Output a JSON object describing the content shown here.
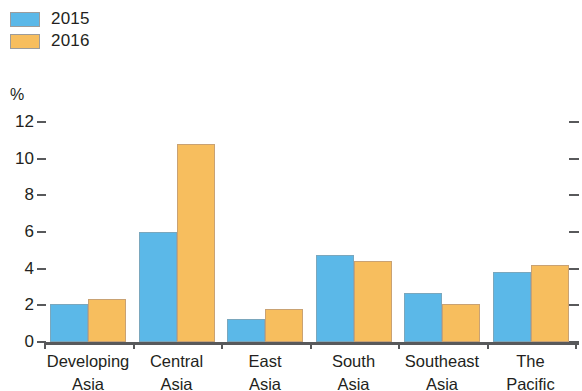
{
  "legend": {
    "items": [
      {
        "label": "2015",
        "color": "#5bb8e8",
        "icon": "legend-swatch-blue"
      },
      {
        "label": "2016",
        "color": "#f7be5e",
        "icon": "legend-swatch-orange"
      }
    ]
  },
  "axis": {
    "unit": "%",
    "ticks": [
      "12",
      "10",
      "8",
      "6",
      "4",
      "2",
      "0"
    ]
  },
  "chart_data": {
    "type": "bar",
    "title": "",
    "xlabel": "",
    "ylabel": "%",
    "ylim": [
      0,
      12
    ],
    "yticks": [
      0,
      2,
      4,
      6,
      8,
      10,
      12
    ],
    "grid": false,
    "legend_position": "top-left",
    "categories": [
      "Developing\nAsia",
      "Central\nAsia",
      "East\nAsia",
      "South\nAsia",
      "Southeast\nAsia",
      "The\nPacific"
    ],
    "category_lines": [
      [
        "Developing",
        "Asia"
      ],
      [
        "Central",
        "Asia"
      ],
      [
        "East",
        "Asia"
      ],
      [
        "South",
        "Asia"
      ],
      [
        "Southeast",
        "Asia"
      ],
      [
        "The",
        "Pacific"
      ]
    ],
    "series": [
      {
        "name": "2015",
        "color": "#5bb8e8",
        "values": [
          2.1,
          6.0,
          1.25,
          4.75,
          2.65,
          3.8
        ]
      },
      {
        "name": "2016",
        "color": "#f7be5e",
        "values": [
          2.35,
          10.8,
          1.8,
          4.4,
          2.05,
          4.2
        ]
      }
    ]
  }
}
